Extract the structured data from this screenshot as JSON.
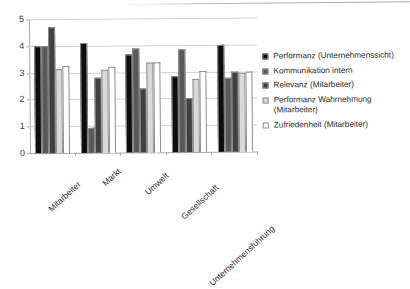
{
  "chart_data": {
    "type": "bar",
    "title": "",
    "subtitle": "",
    "xlabel": "",
    "ylabel": "",
    "ylim": [
      0,
      5
    ],
    "ytick_step": 1,
    "ytick_labels": [
      "0",
      "1",
      "2",
      "3",
      "4",
      "5"
    ],
    "grid": true,
    "legend_position": "right",
    "orientation": "vertical",
    "categories": [
      "Mitarbeiter",
      "Markt",
      "Umwelt",
      "Gesellschaft",
      "Unternehmensführung"
    ],
    "series": [
      {
        "name": "Performanz (Unternehmenssicht)",
        "color": "#0d0d0d",
        "values": [
          4.0,
          4.1,
          3.65,
          2.85,
          3.98
        ]
      },
      {
        "name": "Kommunikation intern",
        "color": "#595959",
        "values": [
          4.0,
          0.95,
          3.88,
          3.85,
          2.78
        ]
      },
      {
        "name": "Relevanz (Mitarbeiter)",
        "color": "#404040",
        "values": [
          4.7,
          2.8,
          2.38,
          2.0,
          3.0
        ]
      },
      {
        "name": "Performanz Wahrnehmung (Mitarbeiter)",
        "color": "#d9d9d9",
        "values": [
          3.15,
          3.1,
          3.37,
          2.72,
          2.95
        ]
      },
      {
        "name": "Zufriedenheit (Mitarbeiter)",
        "color": "#ffffff",
        "values": [
          3.25,
          3.2,
          3.37,
          3.03,
          3.0
        ]
      }
    ]
  },
  "legend": {
    "items": [
      {
        "label": "Performanz (Unternehmenssicht)",
        "swatch": "#0d0d0d"
      },
      {
        "label": "Kommunikation intern",
        "swatch": "#595959"
      },
      {
        "label": "Relevanz (Mitarbeiter)",
        "swatch": "#404040"
      },
      {
        "label": "Performanz Wahrnehmung (Mitarbeiter)",
        "swatch": "#d9d9d9"
      },
      {
        "label": "Zufriedenheit (Mitarbeiter)",
        "swatch": "#ffffff"
      }
    ]
  }
}
